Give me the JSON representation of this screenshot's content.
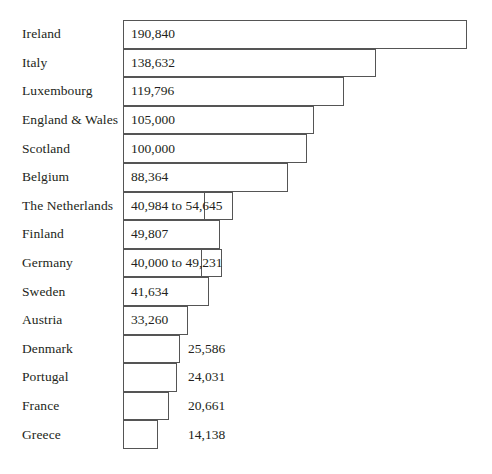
{
  "chart_data": {
    "type": "bar",
    "title": "",
    "subtitle": "",
    "xlabel": "",
    "ylabel": "",
    "orientation": "horizontal",
    "grid": false,
    "legend": false,
    "axis_visible": false,
    "xlim": [
      0,
      190840
    ],
    "categories": [
      "Ireland",
      "Italy",
      "Luxembourg",
      "England & Wales",
      "Scotland",
      "Belgium",
      "The Netherlands",
      "Finland",
      "Germany",
      "Sweden",
      "Austria",
      "Denmark",
      "Portugal",
      "France",
      "Greece"
    ],
    "values": [
      190840,
      138632,
      119796,
      105000,
      100000,
      88364,
      40984,
      49807,
      40000,
      41634,
      33260,
      25586,
      24031,
      20661,
      14138
    ],
    "value_upper": [
      null,
      null,
      null,
      null,
      null,
      null,
      54645,
      null,
      49231,
      null,
      null,
      null,
      null,
      null,
      null
    ],
    "bars": [
      {
        "category": "Ireland",
        "label": "190,840",
        "label_position": "inside",
        "value": 190840,
        "upper": null,
        "bar_end_px": 467,
        "ext_end_px": null
      },
      {
        "category": "Italy",
        "label": "138,632",
        "label_position": "inside",
        "value": 138632,
        "upper": null,
        "bar_end_px": 376,
        "ext_end_px": null
      },
      {
        "category": "Luxembourg",
        "label": "119,796",
        "label_position": "inside",
        "value": 119796,
        "upper": null,
        "bar_end_px": 344,
        "ext_end_px": null
      },
      {
        "category": "England & Wales",
        "label": "105,000",
        "label_position": "inside",
        "value": 105000,
        "upper": null,
        "bar_end_px": 314,
        "ext_end_px": null
      },
      {
        "category": "Scotland",
        "label": "100,000",
        "label_position": "inside",
        "value": 100000,
        "upper": null,
        "bar_end_px": 307,
        "ext_end_px": null
      },
      {
        "category": "Belgium",
        "label": "88,364",
        "label_position": "inside",
        "value": 88364,
        "upper": null,
        "bar_end_px": 288,
        "ext_end_px": null
      },
      {
        "category": "The Netherlands",
        "label": "40,984 to 54,645",
        "label_position": "inside",
        "value": 40984,
        "upper": 54645,
        "bar_end_px": 205,
        "ext_end_px": 233
      },
      {
        "category": "Finland",
        "label": "49,807",
        "label_position": "inside",
        "value": 49807,
        "upper": null,
        "bar_end_px": 220,
        "ext_end_px": null
      },
      {
        "category": "Germany",
        "label": "40,000 to 49,231",
        "label_position": "inside",
        "value": 40000,
        "upper": 49231,
        "bar_end_px": 202,
        "ext_end_px": 222
      },
      {
        "category": "Sweden",
        "label": "41,634",
        "label_position": "inside",
        "value": 41634,
        "upper": null,
        "bar_end_px": 209,
        "ext_end_px": null
      },
      {
        "category": "Austria",
        "label": "33,260",
        "label_position": "inside",
        "value": 33260,
        "upper": null,
        "bar_end_px": 188,
        "ext_end_px": null
      },
      {
        "category": "Denmark",
        "label": "25,586",
        "label_position": "outside",
        "value": 25586,
        "upper": null,
        "bar_end_px": 180,
        "ext_end_px": null
      },
      {
        "category": "Portugal",
        "label": "24,031",
        "label_position": "outside",
        "value": 24031,
        "upper": null,
        "bar_end_px": 177,
        "ext_end_px": null
      },
      {
        "category": "France",
        "label": "20,661",
        "label_position": "outside",
        "value": 20661,
        "upper": null,
        "bar_end_px": 169,
        "ext_end_px": null
      },
      {
        "category": "Greece",
        "label": "14,138",
        "label_position": "outside",
        "value": 14138,
        "upper": null,
        "bar_end_px": 158,
        "ext_end_px": null
      }
    ],
    "colors": {
      "bar_fill": "#ffffff",
      "bar_stroke": "#555555",
      "text": "#231f20",
      "background": "#ffffff"
    },
    "layout": {
      "bar_left_px": 123,
      "first_row_top_px": 20,
      "row_pitch_px": 28.6,
      "row_height_px": 28.6,
      "outside_label_left_px": 188
    }
  }
}
